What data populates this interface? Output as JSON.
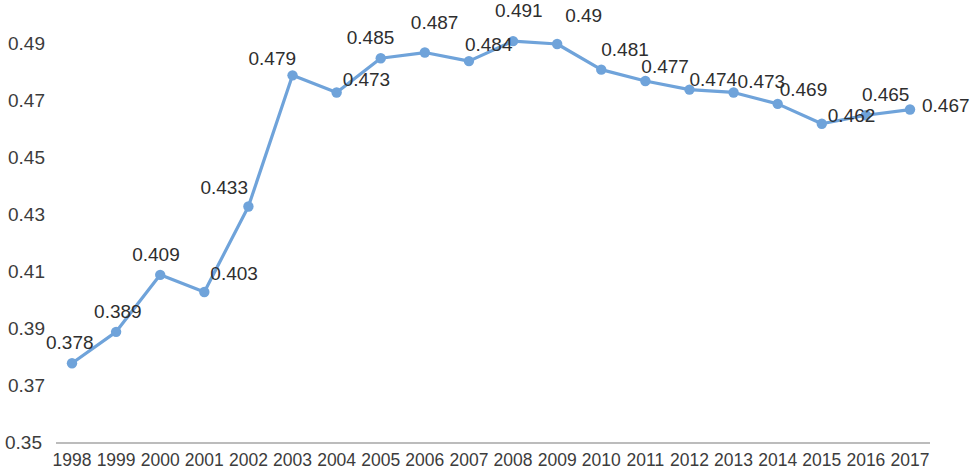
{
  "chart_data": {
    "type": "line",
    "title": "",
    "subtitle": "",
    "xlabel": "",
    "ylabel": "",
    "grid": false,
    "legend": null,
    "legend_position": "none",
    "series_color": "#6FA3DA",
    "marker_color": "#6FA3DA",
    "axis_color": "#A6A6A6",
    "label_color": "#3C3C3C",
    "categories": [
      "1998",
      "1999",
      "2000",
      "2001",
      "2002",
      "2003",
      "2004",
      "2005",
      "2006",
      "2007",
      "2008",
      "2009",
      "2010",
      "2011",
      "2012",
      "2013",
      "2014",
      "2015",
      "2016",
      "2017"
    ],
    "values": [
      0.378,
      0.389,
      0.409,
      0.403,
      0.433,
      0.479,
      0.473,
      0.485,
      0.487,
      0.484,
      0.491,
      0.49,
      0.481,
      0.477,
      0.474,
      0.473,
      0.469,
      0.462,
      0.465,
      0.467
    ],
    "point_labels": [
      "0.378",
      "0.389",
      "0.409",
      "0.403",
      "0.433",
      "0.479",
      "0.473",
      "0.485",
      "0.487",
      "0.484",
      "0.491",
      "0.49",
      "0.481",
      "0.477",
      "0.474",
      "0.473",
      "0.469",
      "0.462",
      "0.465",
      "0.467"
    ],
    "ylim": [
      0.35,
      0.5
    ],
    "yticks": [
      0.35,
      0.37,
      0.39,
      0.41,
      0.43,
      0.45,
      0.47,
      0.49
    ],
    "ytick_labels": [
      "0.35",
      "0.37",
      "0.39",
      "0.41",
      "0.43",
      "0.45",
      "0.47",
      "0.49"
    ],
    "xtick_labels": [
      "1998",
      "1999",
      "2000",
      "2001",
      "2002",
      "2003",
      "2004",
      "2005",
      "2006",
      "2007",
      "2008",
      "2009",
      "2010",
      "2011",
      "2012",
      "2013",
      "2014",
      "2015",
      "2016",
      "2017"
    ]
  }
}
